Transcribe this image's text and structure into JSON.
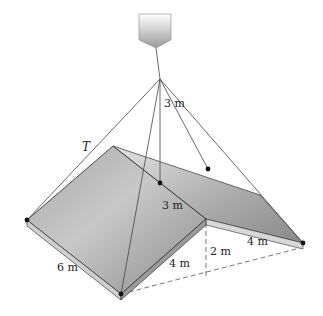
{
  "figure": {
    "labels": {
      "tension": "T",
      "cable_height": "3 m",
      "ridge_drop": "3 m",
      "left_edge": "6 m",
      "front_depth": "4 m",
      "wall_height": "2 m",
      "right_edge": "4 m"
    },
    "colors": {
      "roof_dark": "#8a8a8a",
      "roof_light": "#d4d4d4",
      "edge": "#333333",
      "cable": "#444444"
    }
  }
}
